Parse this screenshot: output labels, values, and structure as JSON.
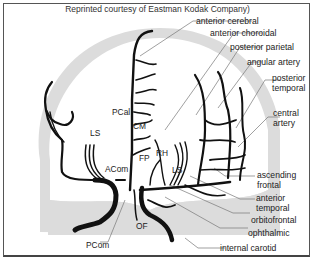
{
  "caption": "Reprinted courtesy of Eastman Kodak Company)",
  "colors": {
    "skull": "#dcdcdc",
    "brain": "#ffffff",
    "vessel": "#111111",
    "leader_line": "#666666",
    "border": "#555555"
  },
  "labels_right": [
    {
      "text": "anterior cerebral"
    },
    {
      "text": "anterior choroidal"
    },
    {
      "text": "posterior parietal"
    },
    {
      "text": "angular artery"
    },
    {
      "line1": "posterior",
      "line2": "temporal"
    },
    {
      "line1": "central",
      "line2": "artery"
    },
    {
      "line1": "ascending",
      "line2": "frontal"
    },
    {
      "line1": "anterior",
      "line2": "temporal"
    },
    {
      "text": "orbitofrontal"
    },
    {
      "text": "ophthalmic"
    },
    {
      "text": "internal carotid"
    }
  ],
  "labels_inner": {
    "pcal": "PCal",
    "cm": "CM",
    "rh": "RH",
    "fp": "FP",
    "ls_left": "LS",
    "ls_right": "LS",
    "acom": "ACom",
    "of": "OF",
    "pcom": "PCom"
  }
}
